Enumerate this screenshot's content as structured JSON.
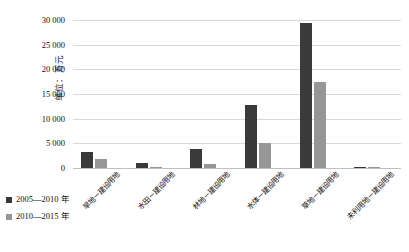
{
  "chart_data": {
    "type": "bar",
    "title": "",
    "xlabel": "",
    "ylabel": "单位：万元",
    "ylim": [
      0,
      30000
    ],
    "yticks": [
      0,
      5000,
      10000,
      15000,
      20000,
      25000,
      30000
    ],
    "ytick_labels": [
      "0",
      "5 000",
      "10 000",
      "15 000",
      "20 000",
      "25 000",
      "30 000"
    ],
    "grid": true,
    "legend_position": "bottom-left",
    "categories": [
      "旱地－建设用地",
      "水田－建设用地",
      "林地－建设用地",
      "水体－建设用地",
      "草地－建设用地",
      "未利用地－建设用地"
    ],
    "series": [
      {
        "name": "2005—2010 年",
        "color": "#3a3a3a",
        "values": [
          3300,
          1100,
          3800,
          12800,
          29300,
          300
        ]
      },
      {
        "name": "2010—2015 年",
        "color": "#969696",
        "values": [
          1900,
          300,
          900,
          5000,
          17500,
          200
        ]
      }
    ]
  },
  "axis": {
    "y_title": "单位：万元"
  },
  "legend": {
    "items": [
      {
        "label": "2005—2010 年",
        "color": "#3a3a3a"
      },
      {
        "label": "2010—2015 年",
        "color": "#969696"
      }
    ]
  }
}
